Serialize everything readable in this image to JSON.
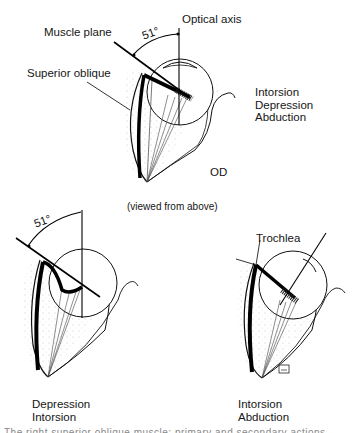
{
  "figure": {
    "top": {
      "labels": {
        "optical_axis": "Optical axis",
        "muscle_plane": "Muscle plane",
        "angle": "51°",
        "superior_oblique": "Superior oblique",
        "eye": "OD",
        "view_note": "(viewed from above)"
      },
      "actions": [
        "Intorsion",
        "Depression",
        "Abduction"
      ]
    },
    "bottom_left": {
      "angle": "51°",
      "actions": [
        "Depression",
        "Intorsion"
      ]
    },
    "bottom_right": {
      "labels": {
        "trochlea": "Trochlea"
      },
      "actions": [
        "Intorsion",
        "Abduction"
      ]
    },
    "caption": "The right superior oblique muscle: primary and secondary actions"
  }
}
